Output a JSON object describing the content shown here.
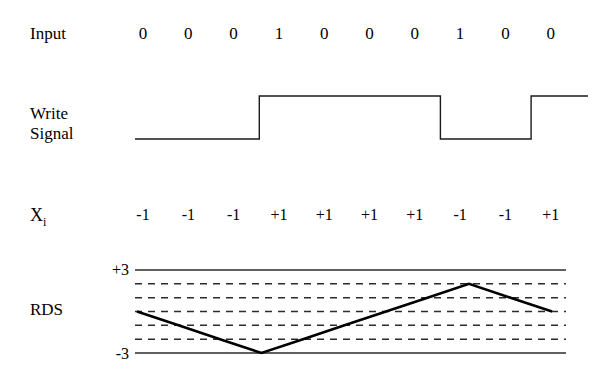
{
  "rows": {
    "input_label": "Input",
    "write_label": "Write\nSignal",
    "xi_label": "X",
    "xi_subscript": "i",
    "rds_label": "RDS"
  },
  "axis": {
    "top_tick": "+3",
    "bottom_tick": "-3"
  },
  "chart_data": {
    "type": "line",
    "title": "",
    "xlabel": "",
    "ylabel": "RDS",
    "ylim": [
      -3,
      3
    ],
    "grid": true,
    "gridlines_solid": [
      3,
      -3
    ],
    "gridlines_dashed": [
      2,
      1,
      0,
      -1,
      -2
    ],
    "categories": [
      1,
      2,
      3,
      4,
      5,
      6,
      7,
      8,
      9,
      10
    ],
    "series": [
      {
        "name": "Input",
        "type": "bits",
        "values": [
          0,
          0,
          0,
          1,
          0,
          0,
          0,
          1,
          0,
          0
        ]
      },
      {
        "name": "Write Signal",
        "type": "digital",
        "values": [
          0,
          0,
          0,
          1,
          1,
          1,
          1,
          0,
          0,
          1
        ],
        "low_level": 0,
        "high_level": 1
      },
      {
        "name": "Xi",
        "type": "labels",
        "values": [
          "-1",
          "-1",
          "-1",
          "+1",
          "+1",
          "+1",
          "+1",
          "-1",
          "-1",
          "+1"
        ],
        "numeric": [
          -1,
          -1,
          -1,
          1,
          1,
          1,
          1,
          -1,
          -1,
          1
        ]
      },
      {
        "name": "RDS",
        "type": "line",
        "x": [
          0,
          1,
          2,
          3,
          4,
          5,
          6,
          7,
          8,
          9,
          10
        ],
        "values": [
          0,
          -1,
          -2,
          -3,
          -2,
          -1,
          0,
          1,
          2,
          1,
          0
        ]
      }
    ]
  }
}
